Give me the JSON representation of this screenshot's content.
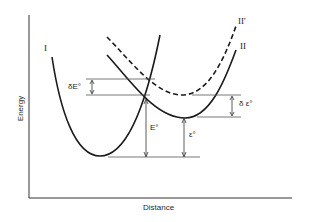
{
  "axes": {
    "y_label": "Energy",
    "x_label": "Distance"
  },
  "curves": {
    "I": {
      "label": "I",
      "style": "solid"
    },
    "II": {
      "label": "II",
      "style": "solid"
    },
    "II_prime": {
      "label": "II'",
      "style": "dashed"
    }
  },
  "annotations": {
    "delta_E0": "δE°",
    "E0": "E°",
    "epsilon0": "ε°",
    "delta_epsilon0": "δ ε°"
  },
  "colors": {
    "line": "#1a1a1a",
    "guide": "#555555",
    "background": "#ffffff"
  }
}
